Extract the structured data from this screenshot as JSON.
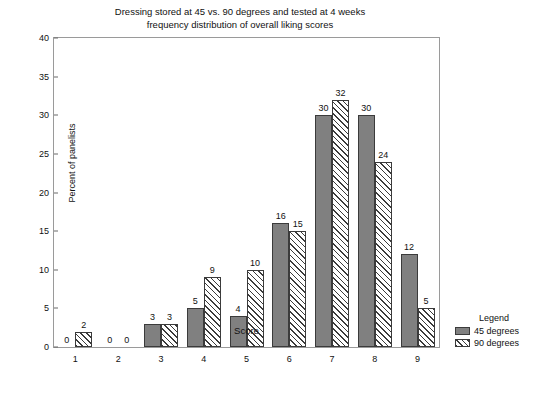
{
  "chart_data": {
    "type": "bar",
    "title": "Dressing stored at 45 vs. 90 degrees and tested at 4 weeks\nfrequency distribution of overall liking scores",
    "title_line1": "Dressing stored at 45 vs. 90 degrees and tested at 4 weeks",
    "title_line2": "frequency distribution of overall liking scores",
    "xlabel": "Score",
    "ylabel": "Percent of panelists",
    "categories": [
      "1",
      "2",
      "3",
      "4",
      "5",
      "6",
      "7",
      "8",
      "9"
    ],
    "series": [
      {
        "name": "45 degrees",
        "values": [
          0,
          0,
          3,
          5,
          4,
          16,
          30,
          30,
          12
        ],
        "fill": "solid",
        "color": "#808080"
      },
      {
        "name": "90 degrees",
        "values": [
          2,
          0,
          3,
          9,
          10,
          15,
          32,
          24,
          5
        ],
        "fill": "hatch",
        "color": "#ffffff"
      }
    ],
    "ylim": [
      0,
      40
    ],
    "yticks": [
      0,
      5,
      10,
      15,
      20,
      25,
      30,
      35,
      40
    ],
    "ytick_labels": [
      "0",
      "5",
      "10",
      "15",
      "20",
      "25",
      "30",
      "35",
      "40"
    ],
    "grid": false,
    "legend_position": "right",
    "legend_title": "Legend"
  }
}
